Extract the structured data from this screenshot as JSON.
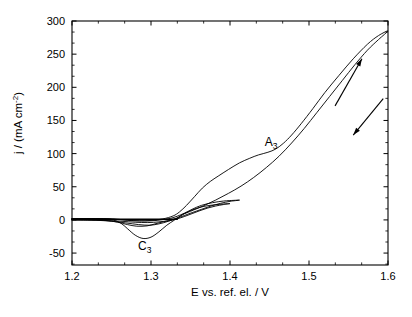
{
  "chart_data": {
    "type": "line",
    "title": "",
    "subtitle": "",
    "xlabel": "E vs. ref. el. / V",
    "ylabel": "j / (mA cm-2)",
    "ylabel_parts": {
      "main": "j / (mA cm",
      "superscript": "-2",
      "tail": ")"
    },
    "xlim": [
      1.2,
      1.6
    ],
    "ylim": [
      -68,
      300
    ],
    "xticks": [
      1.2,
      1.3,
      1.4,
      1.5,
      1.6
    ],
    "xtick_labels": [
      "1.2",
      "1.3",
      "1.4",
      "1.5",
      "1.6"
    ],
    "yticks": [
      -50,
      0,
      50,
      100,
      150,
      200,
      250,
      300
    ],
    "ytick_labels": [
      "-50",
      "0",
      "50",
      "100",
      "150",
      "200",
      "250",
      "300"
    ],
    "x_minor_per_major": 2,
    "y_minor_per_major": 2,
    "grid": false,
    "legend": null,
    "frame": "box",
    "annotations": [
      {
        "text": "A",
        "subscript": "3",
        "x": 1.452,
        "y": 112,
        "name": "anodic-peak-label"
      },
      {
        "text": "C",
        "subscript": "3",
        "x": 1.292,
        "y": -45,
        "name": "cathodic-peak-label"
      }
    ],
    "direction_arrows": [
      {
        "name": "forward-scan-arrow",
        "direction": "up-right",
        "x1": 1.533,
        "y1": 172,
        "x2": 1.567,
        "y2": 243
      },
      {
        "name": "reverse-scan-arrow",
        "direction": "down-left",
        "x1": 1.594,
        "y1": 183,
        "x2": 1.556,
        "y2": 128
      }
    ],
    "features": [
      {
        "label": "C3",
        "type": "cathodic peak",
        "peak_potential_V": 1.29,
        "peak_current_mA_cm2": -28
      },
      {
        "label": "A3",
        "type": "anodic wave/shoulder",
        "potential_V": 1.45,
        "current_mA_cm2": 100
      },
      {
        "label": "crossover",
        "type": "nucleation crossover",
        "potential_V": 1.333,
        "current_mA_cm2": 0
      },
      {
        "label": "max",
        "type": "maximum current at vertex",
        "potential_V": 1.6,
        "current_mA_cm2": 285
      }
    ],
    "series": [
      {
        "name": "cycle-small-vertex-1.40V",
        "vertex_V": 1.4,
        "forward": [
          [
            1.2,
            2.0
          ],
          [
            1.22,
            2.0
          ],
          [
            1.24,
            1.8
          ],
          [
            1.255,
            1.2
          ],
          [
            1.265,
            0.2
          ],
          [
            1.275,
            -1.0
          ],
          [
            1.285,
            -1.6
          ],
          [
            1.3,
            -1.4
          ],
          [
            1.315,
            0.4
          ],
          [
            1.325,
            2.5
          ],
          [
            1.333,
            5.5
          ],
          [
            1.342,
            10.0
          ],
          [
            1.352,
            15.0
          ],
          [
            1.362,
            19.0
          ],
          [
            1.372,
            21.5
          ],
          [
            1.382,
            23.0
          ],
          [
            1.392,
            24.0
          ],
          [
            1.4,
            24.6
          ]
        ],
        "reverse": [
          [
            1.4,
            24.6
          ],
          [
            1.392,
            23.2
          ],
          [
            1.382,
            21.0
          ],
          [
            1.372,
            18.0
          ],
          [
            1.362,
            14.0
          ],
          [
            1.352,
            9.5
          ],
          [
            1.342,
            5.0
          ],
          [
            1.333,
            1.5
          ],
          [
            1.324,
            -1.0
          ],
          [
            1.315,
            -3.0
          ],
          [
            1.305,
            -6.0
          ],
          [
            1.295,
            -9.0
          ],
          [
            1.282,
            -9.5
          ],
          [
            1.27,
            -7.0
          ],
          [
            1.258,
            -3.5
          ],
          [
            1.246,
            -1.2
          ],
          [
            1.232,
            -0.3
          ],
          [
            1.215,
            0.0
          ],
          [
            1.2,
            0.0
          ]
        ]
      },
      {
        "name": "cycle-medium-vertex-1.41V",
        "vertex_V": 1.41,
        "forward": [
          [
            1.2,
            2.0
          ],
          [
            1.225,
            2.0
          ],
          [
            1.243,
            1.5
          ],
          [
            1.252,
            0.0
          ],
          [
            1.262,
            -5.0
          ],
          [
            1.27,
            -13.0
          ],
          [
            1.28,
            -23.0
          ],
          [
            1.29,
            -28.0
          ],
          [
            1.3,
            -26.0
          ],
          [
            1.31,
            -18.0
          ],
          [
            1.32,
            -8.0
          ],
          [
            1.33,
            0.0
          ],
          [
            1.34,
            8.0
          ],
          [
            1.352,
            16.0
          ],
          [
            1.364,
            22.0
          ],
          [
            1.378,
            26.0
          ],
          [
            1.392,
            28.5
          ],
          [
            1.405,
            29.5
          ],
          [
            1.412,
            29.8
          ]
        ],
        "reverse": [
          [
            1.412,
            29.8
          ],
          [
            1.4,
            28.0
          ],
          [
            1.388,
            25.0
          ],
          [
            1.376,
            21.0
          ],
          [
            1.364,
            16.0
          ],
          [
            1.352,
            11.0
          ],
          [
            1.342,
            6.5
          ],
          [
            1.333,
            2.5
          ],
          [
            1.322,
            -1.0
          ],
          [
            1.31,
            -3.0
          ],
          [
            1.296,
            -4.0
          ],
          [
            1.28,
            -3.5
          ],
          [
            1.262,
            -2.0
          ],
          [
            1.242,
            -0.8
          ],
          [
            1.22,
            -0.2
          ],
          [
            1.2,
            0.0
          ]
        ]
      },
      {
        "name": "cycle-large-vertex-1.60V",
        "vertex_V": 1.6,
        "forward": [
          [
            1.2,
            2.0
          ],
          [
            1.23,
            2.0
          ],
          [
            1.248,
            1.4
          ],
          [
            1.258,
            0.5
          ],
          [
            1.27,
            -0.5
          ],
          [
            1.285,
            -1.2
          ],
          [
            1.3,
            -0.8
          ],
          [
            1.315,
            1.5
          ],
          [
            1.328,
            6.0
          ],
          [
            1.336,
            12.0
          ],
          [
            1.345,
            22.0
          ],
          [
            1.355,
            35.0
          ],
          [
            1.365,
            48.0
          ],
          [
            1.375,
            58.0
          ],
          [
            1.385,
            66.0
          ],
          [
            1.398,
            76.0
          ],
          [
            1.412,
            86.0
          ],
          [
            1.425,
            93.0
          ],
          [
            1.436,
            98.0
          ],
          [
            1.448,
            102.0
          ],
          [
            1.458,
            107.0
          ],
          [
            1.468,
            116.0
          ],
          [
            1.478,
            128.0
          ],
          [
            1.49,
            145.0
          ],
          [
            1.505,
            168.0
          ],
          [
            1.52,
            192.0
          ],
          [
            1.538,
            218.0
          ],
          [
            1.556,
            243.0
          ],
          [
            1.574,
            265.0
          ],
          [
            1.588,
            278.0
          ],
          [
            1.6,
            285.0
          ]
        ],
        "reverse": [
          [
            1.6,
            285.0
          ],
          [
            1.588,
            272.0
          ],
          [
            1.574,
            256.0
          ],
          [
            1.558,
            234.0
          ],
          [
            1.542,
            210.0
          ],
          [
            1.526,
            186.0
          ],
          [
            1.51,
            162.0
          ],
          [
            1.494,
            138.0
          ],
          [
            1.478,
            116.0
          ],
          [
            1.462,
            96.0
          ],
          [
            1.446,
            79.0
          ],
          [
            1.43,
            64.0
          ],
          [
            1.414,
            51.0
          ],
          [
            1.398,
            40.0
          ],
          [
            1.382,
            30.0
          ],
          [
            1.366,
            21.0
          ],
          [
            1.35,
            13.0
          ],
          [
            1.34,
            8.0
          ],
          [
            1.333,
            3.0
          ],
          [
            1.322,
            -2.0
          ],
          [
            1.31,
            -6.0
          ],
          [
            1.298,
            -8.0
          ],
          [
            1.284,
            -7.0
          ],
          [
            1.268,
            -4.5
          ],
          [
            1.25,
            -2.0
          ],
          [
            1.23,
            -0.5
          ],
          [
            1.21,
            0.0
          ],
          [
            1.2,
            0.0
          ]
        ]
      }
    ],
    "baseline_segment": {
      "name": "thick-baseline",
      "description": "overlapping flat traces near zero current",
      "x_start": 1.2,
      "x_end": 1.333,
      "y": 1.0
    }
  }
}
